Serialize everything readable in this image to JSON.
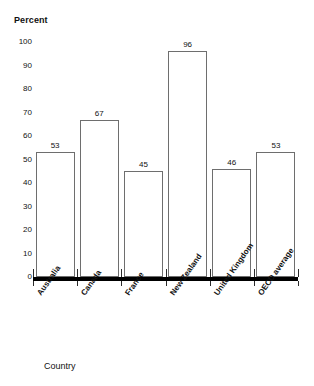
{
  "chart_data": {
    "type": "bar",
    "title": "",
    "xlabel": "Country",
    "ylabel": "Percent",
    "categories": [
      "Australia",
      "Canada",
      "France",
      "New Zealand",
      "United Kingdom",
      "OECD average"
    ],
    "values": [
      53,
      67,
      45,
      96,
      46,
      53
    ],
    "ylim": [
      0,
      100
    ],
    "y_ticks": [
      100,
      90,
      80,
      70,
      60,
      50,
      40,
      30,
      20,
      10,
      0
    ],
    "y_tick_labels": [
      "100",
      "90",
      "80",
      "70",
      "60",
      "50",
      "40",
      "30",
      "20",
      "10",
      "0"
    ],
    "value_labels": [
      "53",
      "67",
      "45",
      "96",
      "46",
      "53"
    ],
    "grid": false,
    "legend": null,
    "colors": {
      "bar_fill": "#ffffff",
      "bar_stroke": "#6e6e6e",
      "axis": "#000000",
      "text": "#111111",
      "background": "#ffffff"
    }
  }
}
